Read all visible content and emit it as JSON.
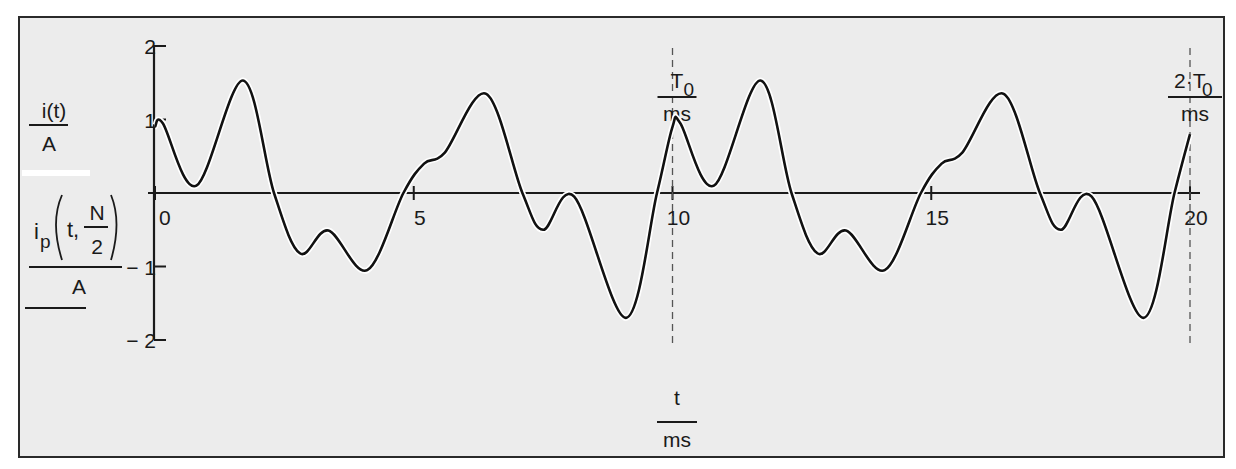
{
  "chart_data": {
    "type": "line",
    "title": "",
    "xlabel": {
      "num": "t",
      "den": "ms"
    },
    "ylabel_1": {
      "num": "i(t)",
      "den": "A"
    },
    "ylabel_2": {
      "num": "i_p(t, N/2)",
      "den": "A",
      "func": "i",
      "sub": "p",
      "arg": "t,",
      "frac_num": "N",
      "frac_den": "2"
    },
    "xlim": [
      0,
      20
    ],
    "ylim": [
      -2,
      2
    ],
    "x_ticks": [
      0,
      5,
      10,
      15,
      20
    ],
    "x_tick_labels": [
      "0",
      "5",
      "10",
      "15",
      "20"
    ],
    "y_ticks": [
      2,
      1,
      0,
      -1,
      -2
    ],
    "y_tick_labels": [
      "2",
      "1",
      "",
      "− 1",
      "− 2"
    ],
    "grid": false,
    "markers": [
      {
        "x": 10,
        "label_num": "T",
        "label_sub": "0",
        "label_den": "ms",
        "style": "dashed"
      },
      {
        "x": 20,
        "label_num": "2·T",
        "label_sub": "0",
        "label_den": "ms",
        "style": "dashed"
      }
    ],
    "period_ms": 10,
    "series": [
      {
        "name": "i(t)",
        "x": [
          0,
          0.15,
          0.8,
          1.7,
          2.3,
          2.8,
          3.35,
          4.1,
          4.8,
          5.2,
          5.6,
          6.4,
          7.1,
          7.5,
          8.1,
          9.1,
          9.7,
          10,
          10.15,
          10.8,
          11.7,
          12.3,
          12.8,
          13.35,
          14.1,
          14.8,
          15.2,
          15.6,
          16.4,
          17.1,
          17.5,
          18.1,
          19.1,
          19.7,
          20
        ],
        "values": [
          0.9,
          0.95,
          0.1,
          1.53,
          0.0,
          -0.82,
          -0.51,
          -1.05,
          0.0,
          0.4,
          0.55,
          1.35,
          0.0,
          -0.5,
          -0.05,
          -1.7,
          0.0,
          0.9,
          0.95,
          0.1,
          1.53,
          0.0,
          -0.82,
          -0.51,
          -1.05,
          0.0,
          0.4,
          0.55,
          1.35,
          0.0,
          -0.5,
          -0.05,
          -1.7,
          0.0,
          0.8
        ]
      }
    ]
  }
}
